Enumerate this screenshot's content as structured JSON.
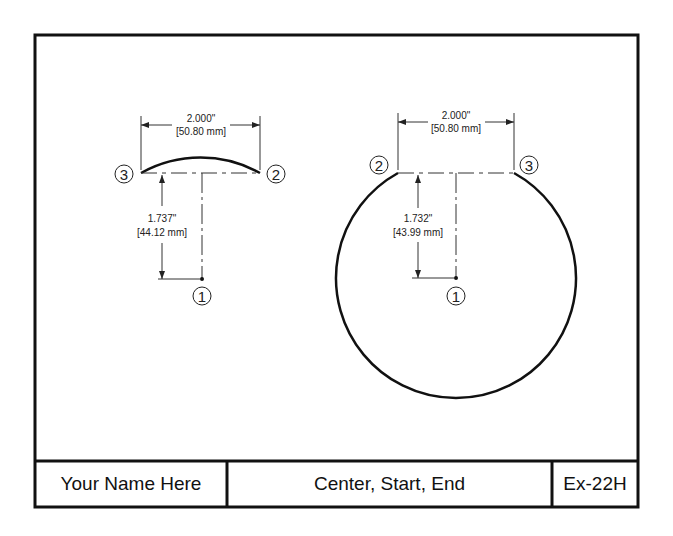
{
  "title_block": {
    "name": "Your Name Here",
    "title": "Center, Start, End",
    "exercise": "Ex-22H"
  },
  "left_figure": {
    "width_dim_in": "2.000\"",
    "width_dim_mm": "[50.80 mm]",
    "height_dim_in": "1.737\"",
    "height_dim_mm": "[44.12 mm]",
    "labels": {
      "center": "1",
      "start": "2",
      "end": "3"
    }
  },
  "right_figure": {
    "width_dim_in": "2.000\"",
    "width_dim_mm": "[50.80 mm]",
    "height_dim_in": "1.732\"",
    "height_dim_mm": "[43.99 mm]",
    "labels": {
      "center": "1",
      "start": "2",
      "end": "3"
    }
  },
  "colors": {
    "line": "#111111",
    "dim": "#333333",
    "background": "#ffffff"
  }
}
